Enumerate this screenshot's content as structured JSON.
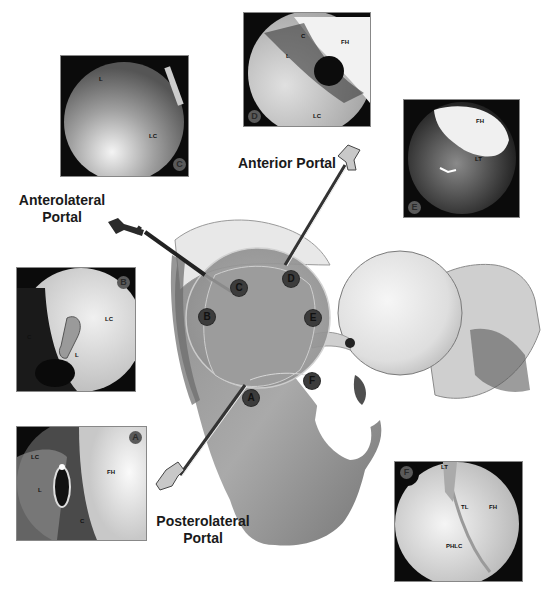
{
  "figure": {
    "type": "anatomical-diagram",
    "portals": [
      {
        "id": "anterolateral",
        "label_line1": "Anterolateral",
        "label_line2": "Portal"
      },
      {
        "id": "anterior",
        "label_line1": "Anterior Portal",
        "label_line2": ""
      },
      {
        "id": "posterolateral",
        "label_line1": "Posterolateral",
        "label_line2": "Portal"
      }
    ],
    "acetabulum_markers": [
      "A",
      "B",
      "C",
      "D",
      "E",
      "F"
    ],
    "panels": [
      {
        "id": "C",
        "badge": "C",
        "labels": [
          "L",
          "LC"
        ]
      },
      {
        "id": "D",
        "badge": "D",
        "labels": [
          "C",
          "FH",
          "L",
          "LC"
        ]
      },
      {
        "id": "E",
        "badge": "E",
        "labels": [
          "FH",
          "LT"
        ]
      },
      {
        "id": "B",
        "badge": "B",
        "labels": [
          "C",
          "LC",
          "L"
        ]
      },
      {
        "id": "A",
        "badge": "A",
        "labels": [
          "LC",
          "FH",
          "L",
          "C"
        ]
      },
      {
        "id": "F",
        "badge": "F",
        "labels": [
          "LT",
          "TL",
          "FH",
          "PHLC"
        ]
      }
    ]
  },
  "colors": {
    "background": "#ffffff",
    "panel_bg": "#0b0b0b",
    "text": "#1a1a1a",
    "marker": "#3c3c3c",
    "acetabulum_overlay": "#9a9a9a",
    "femoral_head": "#e6e6e6"
  }
}
